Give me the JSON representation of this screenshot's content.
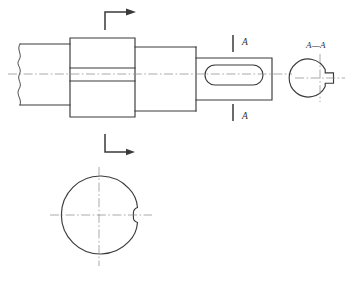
{
  "drawing": {
    "title": "Shaft with Keyways — Orthographic Technical Drawing",
    "type": "mechanical-engineering-drawing",
    "background_color": "#ffffff",
    "line_color": "#3a3a3a",
    "centerline_color": "#8d8d8d",
    "labels": {
      "section_label_top": "A",
      "section_label_bottom": "A",
      "section_view_title": "A—A"
    },
    "views": [
      {
        "name": "front-elevation-view",
        "description": "Stepped shaft in elevation with break line at left, central boss with keyway, and right journal with closed keyway slot"
      },
      {
        "name": "section-view-a-a",
        "description": "Circular cross-section at A—A showing open keyway notch on right side"
      },
      {
        "name": "end-circular-view",
        "description": "Circular end view showing shaft outer diameter with small keyway profile on right"
      }
    ],
    "geometry": {
      "axis_y": 74,
      "shaft_left": {
        "x_start": 15,
        "x_end": 70,
        "top": 44,
        "bottom": 105,
        "break_line": true
      },
      "boss": {
        "x_start": 70,
        "x_end": 135,
        "top": 38,
        "bottom": 117,
        "keyway_top_y": 68,
        "keyway_bottom_y": 81
      },
      "shaft_middle": {
        "x_start": 135,
        "x_end": 196,
        "top": 47,
        "bottom": 111
      },
      "shaft_right": {
        "x_start": 196,
        "x_end": 272,
        "top": 58,
        "bottom": 100
      },
      "keyway_slot": {
        "x_start": 205,
        "x_end": 263,
        "top": 65,
        "bottom": 85,
        "radius": 10,
        "shape": "stadium"
      },
      "section_view_circle": {
        "cx": 320,
        "cy": 78,
        "r": 19,
        "notch_depth": 6,
        "notch_height": 10
      },
      "end_view_circle": {
        "cx": 99,
        "cy": 215,
        "r": 39,
        "notch_depth": 4,
        "notch_height": 13
      },
      "section_marks": {
        "top_line_x": 233,
        "top_line_y1": 35,
        "top_line_y2": 52,
        "bottom_line_x": 233,
        "bottom_line_y1": 104,
        "bottom_line_y2": 121,
        "label_top_x": 242,
        "label_top_y": 42,
        "label_bottom_x": 242,
        "label_bottom_y": 117
      },
      "view_arrows": {
        "top_arrow": {
          "corner_x": 105,
          "corner_y": 12,
          "vertical_to_y": 30,
          "horizontal_to_x": 128,
          "direction": "right"
        },
        "bottom_arrow": {
          "corner_x": 105,
          "corner_y": 152,
          "vertical_from_y": 134,
          "horizontal_to_x": 128,
          "direction": "right"
        }
      }
    }
  }
}
